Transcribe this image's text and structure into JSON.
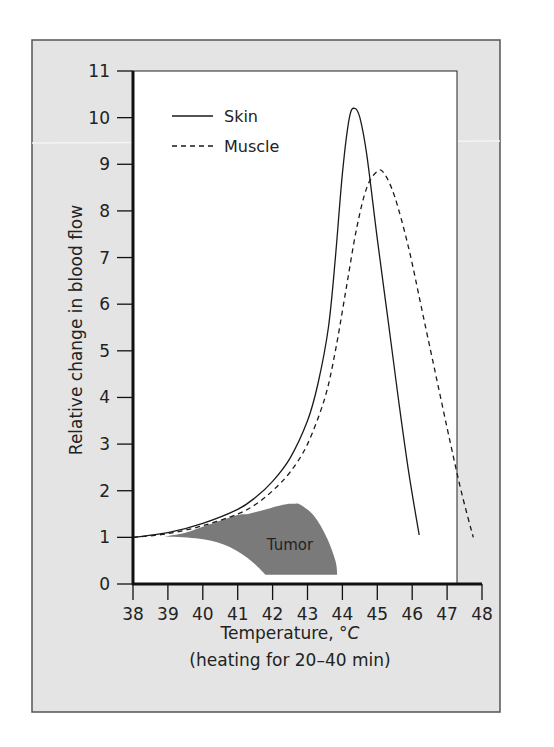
{
  "chart_data": {
    "type": "line",
    "title": "",
    "xlabel": "Temperature, °C",
    "xlabel_main": "Temperature, ",
    "xlabel_unit": "°C",
    "xlabel_sub": "(heating for 20–40 min)",
    "ylabel": "Relative change in blood flow",
    "xlim": [
      38,
      48
    ],
    "ylim": [
      0,
      11
    ],
    "x_ticks": [
      38,
      39,
      40,
      41,
      42,
      43,
      44,
      45,
      46,
      47,
      48
    ],
    "y_ticks": [
      0,
      1,
      2,
      3,
      4,
      5,
      6,
      7,
      8,
      9,
      10,
      11
    ],
    "grid": false,
    "legend_position": "upper-left",
    "legend": [
      {
        "label": "Skin",
        "style": "solid"
      },
      {
        "label": "Muscle",
        "style": "dashed"
      }
    ],
    "series": [
      {
        "name": "Skin",
        "style": "solid",
        "color": "#1a1a1a",
        "x": [
          38,
          39,
          40,
          41,
          41.5,
          42,
          42.5,
          43,
          43.3,
          43.6,
          43.8,
          44.0,
          44.2,
          44.35,
          44.5,
          44.7,
          45.0,
          45.3,
          45.6,
          45.9,
          46.2
        ],
        "y": [
          1.0,
          1.1,
          1.3,
          1.6,
          1.85,
          2.2,
          2.7,
          3.5,
          4.3,
          5.5,
          7.0,
          8.8,
          10.0,
          10.2,
          10.0,
          9.2,
          7.4,
          5.7,
          4.0,
          2.4,
          1.05
        ]
      },
      {
        "name": "Muscle",
        "style": "dashed",
        "color": "#1a1a1a",
        "x": [
          38,
          39,
          40,
          41,
          41.5,
          42,
          42.5,
          43,
          43.5,
          43.8,
          44.1,
          44.4,
          44.7,
          45.0,
          45.2,
          45.5,
          45.9,
          46.3,
          46.7,
          47.1,
          47.4,
          47.75
        ],
        "y": [
          1.0,
          1.08,
          1.25,
          1.5,
          1.7,
          2.0,
          2.4,
          3.0,
          4.0,
          5.0,
          6.3,
          7.6,
          8.5,
          8.85,
          8.8,
          8.3,
          7.2,
          5.8,
          4.4,
          3.0,
          2.0,
          1.0
        ]
      }
    ],
    "region": {
      "name": "Tumor",
      "label": "Tumor",
      "color": "#7a7a7a",
      "upper_boundary": {
        "x": [
          38.9,
          39.5,
          40.2,
          41.0,
          41.3,
          41.8,
          42.3,
          42.6,
          42.8
        ],
        "y": [
          1.02,
          1.1,
          1.28,
          1.48,
          1.5,
          1.6,
          1.7,
          1.72,
          1.7
        ]
      },
      "right_boundary": {
        "x": [
          42.8,
          43.2,
          43.55,
          43.8,
          43.85
        ],
        "y": [
          1.7,
          1.45,
          1.0,
          0.5,
          0.2
        ]
      },
      "bottom": {
        "y": 0.2,
        "x_range": [
          41.8,
          43.85
        ]
      },
      "lower_boundary": {
        "x": [
          41.8,
          41.3,
          40.6,
          39.8,
          38.9
        ],
        "y": [
          0.2,
          0.55,
          0.85,
          0.98,
          1.02
        ]
      }
    }
  },
  "legend": {
    "skin_label": "Skin",
    "muscle_label": "Muscle"
  },
  "annotations": {
    "tumor_label": "Tumor"
  },
  "axes": {
    "y_title": "Relative change in blood flow",
    "x_title_main": "Temperature, ",
    "x_title_unit": "°C",
    "x_subtitle": "(heating for 20–40 min)",
    "x_tick_labels": [
      "38",
      "39",
      "40",
      "41",
      "42",
      "43",
      "44",
      "45",
      "46",
      "47",
      "48"
    ],
    "y_tick_labels": [
      "0",
      "1",
      "2",
      "3",
      "4",
      "5",
      "6",
      "7",
      "8",
      "9",
      "10",
      "11"
    ]
  },
  "colors": {
    "panel_bg": "#e4e4e4",
    "plot_bg": "#ffffff",
    "frame": "#555555",
    "axis": "#111111",
    "tumor_fill": "#7a7a7a"
  }
}
